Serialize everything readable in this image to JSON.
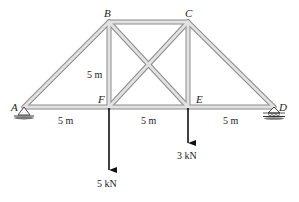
{
  "diagram": {
    "type": "planar truss",
    "nodes": {
      "A": {
        "label": "A"
      },
      "B": {
        "label": "B"
      },
      "C": {
        "label": "C"
      },
      "D": {
        "label": "D"
      },
      "E": {
        "label": "E"
      },
      "F": {
        "label": "F"
      }
    },
    "members": [
      "AB",
      "AF",
      "BF",
      "BC",
      "BE",
      "CF",
      "CE",
      "CD",
      "FE",
      "ED"
    ],
    "supports": {
      "A": "pin",
      "D": "roller"
    },
    "dimensions": {
      "span_AF": "5 m",
      "span_FE": "5 m",
      "span_ED": "5 m",
      "height_BF": "5 m"
    },
    "loads": {
      "F": "5 kN",
      "E": "3 kN"
    },
    "colors": {
      "member_fill": "#d6d6d6",
      "member_edge": "#8a8a8a",
      "load_arrow": "#111111"
    }
  }
}
